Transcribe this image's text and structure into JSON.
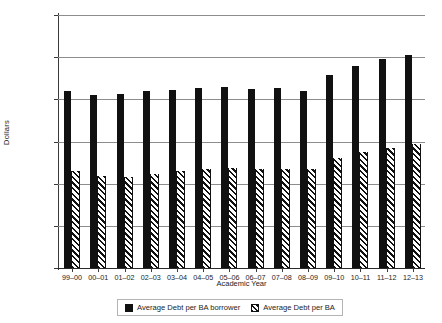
{
  "chart_data": {
    "type": "bar",
    "title": "",
    "xlabel": "Academic Year",
    "ylabel": "Dollars",
    "ylim": [
      0,
      30000
    ],
    "ytick_labels": [
      "$30,000",
      "$25,000",
      "$20,000",
      "$15,000",
      "$10,000",
      "$5,000",
      "$0"
    ],
    "ytick_values": [
      30000,
      25000,
      20000,
      15000,
      10000,
      5000,
      0
    ],
    "grid": true,
    "legend_position": "bottom-center",
    "categories": [
      "99–00",
      "00–01",
      "01–02",
      "02–03",
      "03–04",
      "04–05",
      "05–06",
      "06–07",
      "07–08",
      "08–09",
      "09–10",
      "10–11",
      "11–12",
      "12–13"
    ],
    "series": [
      {
        "name": "Average Debt per BA borrower",
        "pattern": "solid",
        "color": "#111111",
        "values": [
          21000,
          20500,
          20600,
          21000,
          21100,
          21400,
          21500,
          21200,
          21300,
          21000,
          22900,
          24000,
          24800,
          25200
        ]
      },
      {
        "name": "Average Debt per BA",
        "pattern": "diagonal-hatch",
        "color": "#111111",
        "values": [
          11500,
          10900,
          10800,
          11200,
          11500,
          11700,
          11900,
          11800,
          11800,
          11800,
          13000,
          13700,
          14200,
          14700
        ]
      }
    ]
  },
  "legend": {
    "entries": [
      {
        "label": "Average Debt per BA borrower",
        "swatch": "solid-square-icon"
      },
      {
        "label": "Average Debt per BA",
        "swatch": "hatched-square-icon"
      }
    ]
  }
}
